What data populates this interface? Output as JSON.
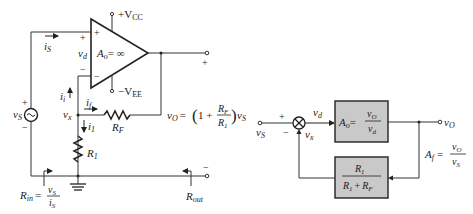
{
  "circuit": {
    "opamp": {
      "gain_label": "A",
      "gain_sub": "o",
      "gain_value": "= ∞",
      "supply_pos": "+V",
      "supply_pos_sub": "CC",
      "supply_neg": "−V",
      "supply_neg_sub": "EE",
      "plus_sign": "+",
      "minus_sign": "−"
    },
    "labels": {
      "is": "i",
      "is_sub": "S",
      "vd": "v",
      "vd_sub": "d",
      "vs": "v",
      "vs_sub": "S",
      "vx": "v",
      "vx_sub": "x",
      "ii": "i",
      "ii_sub": "i",
      "if": "i",
      "if_sub": "f",
      "i1": "i",
      "i1_sub": "1",
      "rf": "R",
      "rf_sub": "F",
      "r1": "R",
      "r1_sub": "1",
      "rout": "R",
      "rout_sub": "out",
      "rin": "R",
      "rin_sub": "in",
      "rin_eq": "=",
      "plus": "+",
      "minus": "−"
    },
    "output_eq": {
      "lhs": "v",
      "lhs_sub": "O",
      "eq": "= ",
      "one_plus": "1 +",
      "num": "R",
      "num_sub": "F",
      "den": "R",
      "den_sub": "1",
      "rhs": "v",
      "rhs_sub": "S"
    }
  },
  "block_diagram": {
    "input": "v",
    "input_sub": "S",
    "plus": "+",
    "minus": "−",
    "vd": "v",
    "vd_sub": "d",
    "vx": "v",
    "vx_sub": "x",
    "forward_block": {
      "lhs": "A",
      "lhs_sub": "o",
      "num": "v",
      "num_sub": "O",
      "den": "v",
      "den_sub": "d"
    },
    "feedback_block": {
      "num": "R",
      "num_sub": "1",
      "den_a": "R",
      "den_a_sub": "1",
      "den_plus": "+",
      "den_b": "R",
      "den_b_sub": "F"
    },
    "output": "v",
    "output_sub": "O",
    "closed_loop": {
      "lhs": "A",
      "lhs_sub": "f",
      "num": "v",
      "num_sub": "O",
      "den": "v",
      "den_sub": "S"
    }
  }
}
